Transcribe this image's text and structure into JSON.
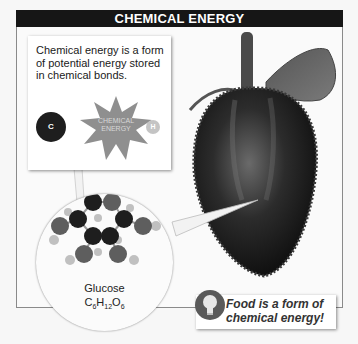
{
  "title": "CHEMICAL ENERGY",
  "callout": {
    "text": "Chemical energy is a form of potential energy stored in chemical bonds.",
    "burst_label_line1": "CHEMICAL",
    "burst_label_line2": "ENERGY",
    "atom_left": "C",
    "atom_right": "H"
  },
  "molecule": {
    "name": "Glucose",
    "formula_parts": [
      "C",
      "6",
      "H",
      "12",
      "O",
      "6"
    ]
  },
  "tip": {
    "icon": "lightbulb-icon",
    "line1": "Food is a form of",
    "line2": "chemical energy!"
  },
  "image": {
    "subject": "strawberry"
  },
  "colors": {
    "title_bg": "#161616",
    "carbon": "#1e1e1e",
    "oxygen": "#5e5e5e",
    "hydrogen": "#b5b5b5",
    "burst": "#8f8f8f"
  }
}
